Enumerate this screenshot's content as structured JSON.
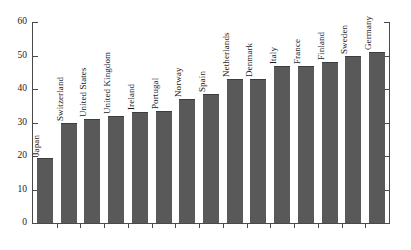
{
  "chart_data": {
    "type": "bar",
    "title": "",
    "subtitle": "",
    "xlabel": "",
    "ylabel": "",
    "ylim": [
      0,
      60
    ],
    "yticks": [
      0,
      10,
      20,
      30,
      40,
      50,
      60
    ],
    "grid": false,
    "legend": null,
    "bar_color": "#595959",
    "axis_color": "#4a4a4a",
    "categories": [
      "Japan",
      "Switzerland",
      "United States",
      "United Kingdom",
      "Ireland",
      "Portugal",
      "Norway",
      "Spain",
      "Netherlands",
      "Denmark",
      "Italy",
      "France",
      "Finland",
      "Sweden",
      "Germany"
    ],
    "values": [
      19.5,
      30,
      31,
      32,
      33,
      33.5,
      37,
      38.5,
      43,
      43,
      47,
      47,
      48,
      50,
      51
    ]
  }
}
